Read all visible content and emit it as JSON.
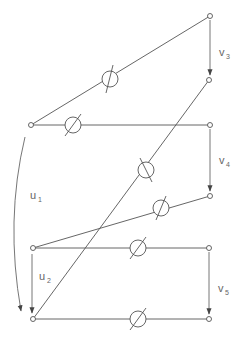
{
  "diagram": {
    "nodes": [
      {
        "id": "r3",
        "x": 210,
        "y": 16
      },
      {
        "id": "r3b",
        "x": 209,
        "y": 80
      },
      {
        "id": "l1",
        "x": 31,
        "y": 125
      },
      {
        "id": "r4",
        "x": 210,
        "y": 125
      },
      {
        "id": "r4b",
        "x": 210,
        "y": 196
      },
      {
        "id": "l2",
        "x": 33,
        "y": 248
      },
      {
        "id": "r5",
        "x": 209,
        "y": 248
      },
      {
        "id": "l3",
        "x": 33,
        "y": 319
      },
      {
        "id": "r5b",
        "x": 209,
        "y": 319
      }
    ],
    "wires": [
      {
        "from": [
          31,
          125
        ],
        "to": [
          210,
          16
        ],
        "shifter": [
          110,
          79
        ]
      },
      {
        "from": [
          31,
          125
        ],
        "to": [
          210,
          125
        ],
        "shifter": [
          73,
          125
        ]
      },
      {
        "from": [
          33,
          319
        ],
        "to": [
          209,
          80
        ],
        "shifter": [
          146,
          170
        ]
      },
      {
        "from": [
          33,
          248
        ],
        "to": [
          210,
          196
        ],
        "shifter": [
          161,
          208
        ]
      },
      {
        "from": [
          33,
          248
        ],
        "to": [
          209,
          248
        ],
        "shifter": [
          138,
          248
        ]
      },
      {
        "from": [
          33,
          319
        ],
        "to": [
          209,
          319
        ],
        "shifter": [
          138,
          319
        ]
      }
    ],
    "labels": {
      "v3": {
        "main": "v",
        "sub": "3"
      },
      "v4": {
        "main": "v",
        "sub": "4"
      },
      "v5": {
        "main": "v",
        "sub": "5"
      },
      "u1": {
        "main": "u",
        "sub": "1"
      },
      "u2": {
        "main": "u",
        "sub": "2"
      }
    }
  }
}
